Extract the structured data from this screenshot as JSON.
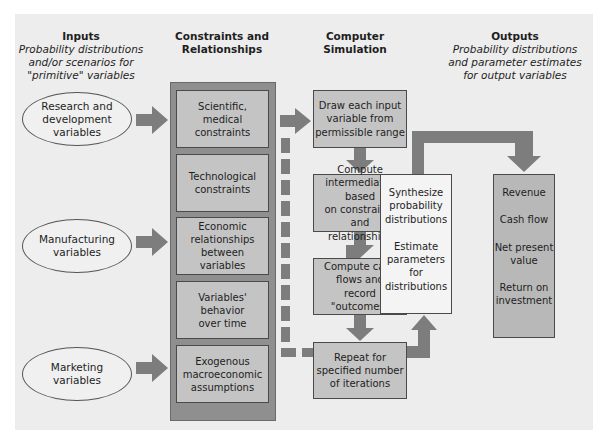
{
  "headers": {
    "inputs": {
      "title": "Inputs",
      "subtitle": [
        "Probability distributions",
        "and/or scenarios for",
        "\"primitive\" variables"
      ]
    },
    "constraints": {
      "title": [
        "Constraints and",
        "Relationships"
      ]
    },
    "simulation": {
      "title": [
        "Computer",
        "Simulation"
      ]
    },
    "outputs": {
      "title": "Outputs",
      "subtitle": [
        "Probability distributions",
        "and parameter estimates",
        "for output variables"
      ]
    }
  },
  "inputs": [
    {
      "lines": [
        "Research and",
        "development",
        "variables"
      ]
    },
    {
      "lines": [
        "Manufacturing",
        "variables"
      ]
    },
    {
      "lines": [
        "Marketing",
        "variables"
      ]
    }
  ],
  "constraints": [
    {
      "lines": [
        "Scientific, medical",
        "constraints"
      ]
    },
    {
      "lines": [
        "Technological",
        "constraints"
      ]
    },
    {
      "lines": [
        "Economic",
        "relationships",
        "between",
        "variables"
      ]
    },
    {
      "lines": [
        "Variables'",
        "behavior",
        "over time"
      ]
    },
    {
      "lines": [
        "Exogenous",
        "macroeconomic",
        "assumptions"
      ]
    }
  ],
  "simulation_steps": [
    {
      "lines": [
        "Draw each input",
        "variable from",
        "permissible range"
      ]
    },
    {
      "lines": [
        "Compute",
        "intermediates based",
        "on constraints and",
        "relationships"
      ]
    },
    {
      "lines": [
        "Compute cash",
        "flows and",
        "record \"outcomes\""
      ]
    },
    {
      "lines": [
        "Repeat for",
        "specified number",
        "of iterations"
      ]
    }
  ],
  "synthesis": {
    "part1": [
      "Synthesize",
      "probability",
      "distributions"
    ],
    "part2": [
      "Estimate",
      "parameters",
      "for",
      "distributions"
    ]
  },
  "outputs": [
    {
      "lines": [
        "Revenue"
      ]
    },
    {
      "lines": [
        "Cash flow"
      ]
    },
    {
      "lines": [
        "Net present",
        "value"
      ]
    },
    {
      "lines": [
        "Return on",
        "investment"
      ]
    }
  ],
  "colors": {
    "arrow": "#7d7d7d",
    "box_fill": "#c4c4c4",
    "column_fill": "#8f8f8f",
    "output_fill": "#b8b8b8",
    "panel": "#ededed"
  }
}
